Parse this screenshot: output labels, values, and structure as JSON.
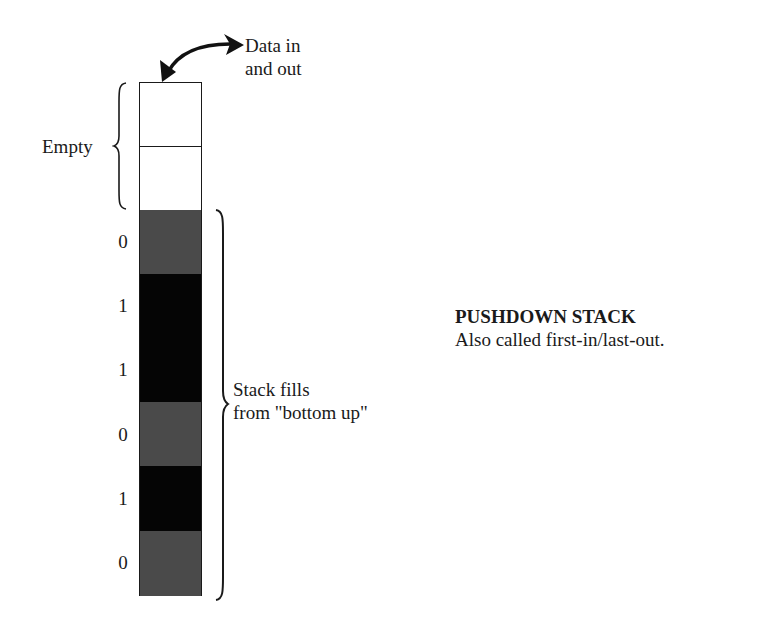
{
  "arrow_label": {
    "line1": "Data in",
    "line2": "and out"
  },
  "empty_label": "Empty",
  "fill_label": {
    "line1": "Stack fills",
    "line2": "from \"bottom up\""
  },
  "title": "PUSHDOWN STACK",
  "subtitle": "Also called first-in/last-out.",
  "stack": {
    "empty_cells": 2,
    "cells": [
      {
        "bit": "0",
        "shade": "gray"
      },
      {
        "bit": "1",
        "shade": "black"
      },
      {
        "bit": "1",
        "shade": "black"
      },
      {
        "bit": "0",
        "shade": "gray"
      },
      {
        "bit": "1",
        "shade": "black"
      },
      {
        "bit": "0",
        "shade": "gray"
      }
    ]
  },
  "colors": {
    "gray_cell": "#4a4a4a",
    "black_cell": "#050505",
    "outline": "#1a1a1a"
  }
}
